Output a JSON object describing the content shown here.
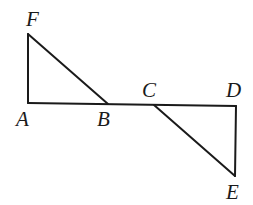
{
  "diagram": {
    "type": "geometry",
    "stroke_color": "#1a1a1a",
    "points": {
      "F": {
        "label": "F",
        "x": 28,
        "y": 34
      },
      "A": {
        "label": "A",
        "x": 28,
        "y": 103
      },
      "B": {
        "label": "B",
        "x": 108,
        "y": 104
      },
      "C": {
        "label": "C",
        "x": 154,
        "y": 105
      },
      "D": {
        "label": "D",
        "x": 236,
        "y": 106
      },
      "E": {
        "label": "E",
        "x": 235,
        "y": 176
      }
    },
    "segments": [
      [
        "A",
        "F"
      ],
      [
        "F",
        "B"
      ],
      [
        "A",
        "D"
      ],
      [
        "C",
        "E"
      ],
      [
        "D",
        "E"
      ]
    ]
  }
}
